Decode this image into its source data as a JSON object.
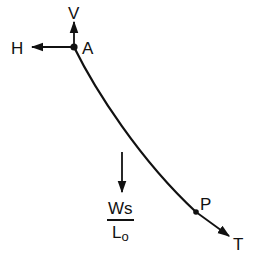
{
  "diagram": {
    "points": {
      "A": {
        "label": "A",
        "x": 74,
        "y": 47
      },
      "P": {
        "label": "P",
        "x": 196,
        "y": 212
      }
    },
    "forces": {
      "vertical": {
        "label": "V"
      },
      "horizontal": {
        "label": "H"
      },
      "tension": {
        "label": "T"
      },
      "weight": {
        "numerator": "Ws",
        "denominator_main": "L",
        "denominator_sub": "o"
      }
    },
    "colors": {
      "stroke": "#111111",
      "background": "#ffffff"
    }
  }
}
